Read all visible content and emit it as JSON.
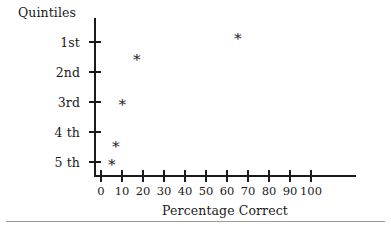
{
  "chart_data": {
    "type": "scatter",
    "title": "",
    "xlabel": "Percentage Correct",
    "ylabel": "Quintiles",
    "xlim": [
      0,
      100
    ],
    "xticks": [
      0,
      10,
      20,
      30,
      40,
      50,
      60,
      70,
      80,
      90,
      100
    ],
    "xtick_labels": [
      "0",
      "10",
      "20",
      "30",
      "40",
      "50",
      "60",
      "70",
      "80",
      "90",
      "100"
    ],
    "ylim": [
      5.5,
      0.3
    ],
    "yticks": [
      1,
      2,
      3,
      4,
      5
    ],
    "ytick_labels": [
      "1st",
      "2nd",
      "3rd",
      "4 th",
      "5 th"
    ],
    "grid": false,
    "legend": null,
    "marker": "*",
    "marker_color": "#1a1a1a",
    "points": [
      {
        "x": 5,
        "y": 5.0,
        "quintile": "5 th"
      },
      {
        "x": 7,
        "y": 4.4,
        "quintile": "4 th"
      },
      {
        "x": 10,
        "y": 3.0,
        "quintile": "3rd"
      },
      {
        "x": 17,
        "y": 1.5,
        "quintile": "1st-2nd"
      },
      {
        "x": 65,
        "y": 0.8,
        "quintile": "above 1st"
      }
    ],
    "series": [
      {
        "name": "Percentage correct by quintile",
        "x": [
          5,
          7,
          10,
          17,
          65
        ],
        "y": [
          5.0,
          4.4,
          3.0,
          1.5,
          0.8
        ]
      }
    ]
  },
  "axes": {
    "y_title": "Quintiles",
    "x_title": "Percentage Correct"
  },
  "marker_glyph": "∗"
}
